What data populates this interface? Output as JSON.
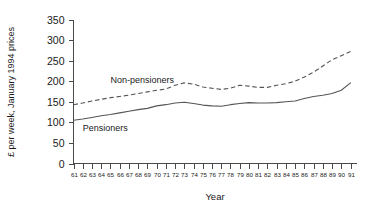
{
  "chart_data": {
    "type": "line",
    "title": "",
    "xlabel": "Year",
    "ylabel": "£ per week, January 1994 prices",
    "xlim": [
      61,
      91
    ],
    "ylim": [
      0,
      350
    ],
    "ytick_step": 50,
    "grid": false,
    "legend_position": "inline-annotation",
    "yticks": [
      "0",
      "50",
      "100",
      "150",
      "200",
      "250",
      "300",
      "350"
    ],
    "x": [
      61,
      62,
      63,
      64,
      65,
      66,
      67,
      68,
      69,
      70,
      71,
      72,
      73,
      74,
      75,
      76,
      77,
      78,
      79,
      80,
      81,
      82,
      83,
      84,
      85,
      86,
      87,
      88,
      89,
      90,
      91
    ],
    "xticks": [
      "61",
      "62",
      "63",
      "64",
      "65",
      "66",
      "67",
      "68",
      "69",
      "70",
      "71",
      "72",
      "73",
      "74",
      "75",
      "76",
      "77",
      "78",
      "79",
      "80",
      "81",
      "82",
      "83",
      "84",
      "85",
      "86",
      "87",
      "88",
      "89",
      "90",
      "91"
    ],
    "series": [
      {
        "name": "Non-pensioners",
        "style": "dashed",
        "label_x": 65,
        "label_y": 196,
        "values": [
          143,
          147,
          152,
          156,
          160,
          163,
          166,
          170,
          174,
          178,
          181,
          190,
          196,
          193,
          186,
          183,
          180,
          183,
          190,
          188,
          185,
          185,
          190,
          194,
          200,
          210,
          222,
          237,
          252,
          262,
          272
        ]
      },
      {
        "name": "Pensioners",
        "style": "solid",
        "label_x": 62,
        "label_y": 78,
        "values": [
          105,
          108,
          112,
          116,
          119,
          123,
          127,
          131,
          134,
          140,
          143,
          147,
          149,
          146,
          142,
          140,
          139,
          143,
          146,
          148,
          147,
          147,
          148,
          150,
          152,
          158,
          163,
          166,
          170,
          178,
          196
        ]
      }
    ]
  }
}
